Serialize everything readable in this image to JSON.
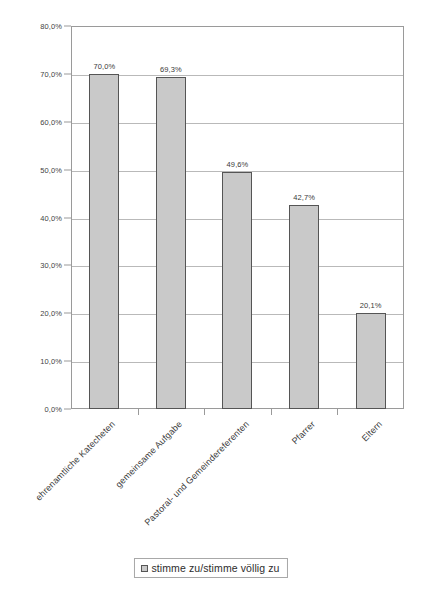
{
  "chart_data": {
    "type": "bar",
    "title": "",
    "subtitle": "",
    "xlabel": "",
    "ylabel": "",
    "ylim": [
      0,
      80
    ],
    "grid": true,
    "legend_position": "bottom",
    "decimal_separator": ",",
    "categories": [
      "ehrenamtliche Katecheten",
      "gemeinsame Aufgabe",
      "Pastoral- und Gemeindereferenten",
      "Pfarrer",
      "Eltern"
    ],
    "values": [
      70.0,
      69.3,
      49.6,
      42.7,
      20.1
    ],
    "value_labels": [
      "70,0%",
      "69,3%",
      "49,6%",
      "42,7%",
      "20,1%"
    ],
    "series": [
      {
        "name": "stimme zu/stimme völlig zu",
        "color": "#c9c9c9",
        "border_color": "#555555",
        "values": [
          70.0,
          69.3,
          49.6,
          42.7,
          20.1
        ]
      }
    ],
    "y_ticks": [
      0,
      10,
      20,
      30,
      40,
      50,
      60,
      70,
      80
    ],
    "y_tick_labels": [
      "0,0%",
      "10,0%",
      "20,0%",
      "30,0%",
      "40,0%",
      "50,0%",
      "60,0%",
      "70,0%",
      "80,0%"
    ]
  },
  "legend": {
    "items": [
      {
        "label": "stimme zu/stimme völlig zu",
        "color": "#c9c9c9"
      }
    ]
  },
  "colors": {
    "bar_fill": "#c9c9c9",
    "bar_border": "#555555",
    "gridline": "#b9b9b9",
    "axis": "#9a9a9a",
    "text": "#3a3a3a",
    "background": "#ffffff"
  }
}
